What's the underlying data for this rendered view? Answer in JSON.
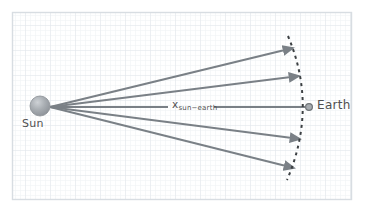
{
  "figure": {
    "background_color": "#ffffff",
    "grid": {
      "minor_color": "#eef1f4",
      "major_color": "#e2e7ec",
      "minor_step": 5,
      "major_step": 25,
      "visible": true
    },
    "frame": {
      "color": "#d8dde2",
      "x": 12,
      "y": 12,
      "width": 340,
      "height": 188
    }
  },
  "labels": {
    "sun": "Sun",
    "earth": "Earth",
    "distance_symbol": "x",
    "distance_subscript": "sun−earth",
    "distance_full": "x_sun−earth"
  },
  "bodies": {
    "sun": {
      "name": "Sun",
      "cx": 40,
      "cy": 106,
      "r": 10,
      "fill": "#9aa0a6",
      "highlight": "#c6cace"
    },
    "earth": {
      "name": "Earth",
      "cx": 309,
      "cy": 107,
      "r": 3.4,
      "fill": "#9aa0a6",
      "stroke": "#6f7478"
    }
  },
  "rays": {
    "color": "#7a8086",
    "width": 2.2,
    "origin_x": 50,
    "origin_y": 107,
    "arrowhead": "solid-triangle",
    "count": 5,
    "items": [
      {
        "name": "ray-top",
        "end_x": 293,
        "end_y": 48
      },
      {
        "name": "ray-upper-middle",
        "end_x": 299,
        "end_y": 76
      },
      {
        "name": "ray-center",
        "end_x": 305,
        "end_y": 107
      },
      {
        "name": "ray-lower-middle",
        "end_x": 300,
        "end_y": 139
      },
      {
        "name": "ray-bottom",
        "end_x": 294,
        "end_y": 168
      }
    ]
  },
  "arc": {
    "name": "wavefront-arc",
    "style": "dashed",
    "color": "#3c4043",
    "width": 2,
    "dash": "3,4",
    "top_x": 288,
    "top_y": 36,
    "mid_x": 309,
    "mid_y": 107,
    "bottom_x": 287,
    "bottom_y": 180
  },
  "distance_line": {
    "name": "distance-indicator",
    "color": "#7a8086",
    "width": 2.2,
    "left_start_x": 52,
    "left_end_x": 168,
    "right_start_x": 214,
    "right_end_x": 305,
    "y": 107
  }
}
